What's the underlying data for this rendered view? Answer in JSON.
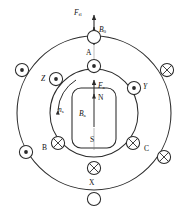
{
  "figure": {
    "type": "machine-cross-section",
    "geometry": {
      "center_x": 94,
      "center_y": 113,
      "outer_circle_r": 77,
      "inner_circle_r": 44,
      "conductor_r": 6.5,
      "rotor": {
        "x": 72,
        "y": 88,
        "w": 44,
        "h": 60,
        "corner_r": 9
      }
    },
    "stroke_color": "#2b2b2b",
    "background_color": "#ffffff"
  },
  "labels": {
    "force_top": {
      "text": "F",
      "sub": "fl"
    },
    "flux_resultant": {
      "text": "B",
      "sub": "0"
    },
    "phase_a": "A",
    "phase_b": "B",
    "phase_c": "C",
    "phase_x": "X",
    "phase_y": "Y",
    "phase_z": "Z",
    "force_armature": {
      "text": "F",
      "sub": "a"
    },
    "flux_armature": {
      "text": "B",
      "sub": "a"
    },
    "speed": {
      "text": "n",
      "sub": "s"
    },
    "pole_north": "N",
    "pole_south": "S"
  },
  "conductors": [
    {
      "id": "outer-top",
      "name": "A-return",
      "marker": "empty",
      "angle_deg": 90,
      "ring": "outer"
    },
    {
      "id": "inner-top",
      "name": "A",
      "marker": "dot",
      "angle_deg": 90,
      "ring": "inner"
    },
    {
      "id": "outer-upper-left",
      "name": "Z-outer",
      "marker": "dot",
      "angle_deg": 160,
      "ring": "outer"
    },
    {
      "id": "inner-upper-left",
      "name": "Z",
      "marker": "dot",
      "angle_deg": 150,
      "ring": "inner"
    },
    {
      "id": "outer-upper-right",
      "name": "Y-outer",
      "marker": "cross",
      "angle_deg": 20,
      "ring": "outer"
    },
    {
      "id": "inner-upper-right",
      "name": "Y",
      "marker": "dot",
      "angle_deg": 30,
      "ring": "inner"
    },
    {
      "id": "outer-lower-left",
      "name": "B-outer",
      "marker": "dot",
      "angle_deg": 200,
      "ring": "outer"
    },
    {
      "id": "inner-lower-left",
      "name": "B",
      "marker": "cross",
      "angle_deg": 210,
      "ring": "inner"
    },
    {
      "id": "outer-lower-right",
      "name": "C-outer",
      "marker": "cross",
      "angle_deg": 340,
      "ring": "outer"
    },
    {
      "id": "inner-lower-right",
      "name": "C",
      "marker": "cross",
      "angle_deg": 330,
      "ring": "inner"
    },
    {
      "id": "inner-bottom",
      "name": "X",
      "marker": "cross",
      "angle_deg": 270,
      "ring": "inner"
    },
    {
      "id": "outer-bottom",
      "name": "X-return",
      "marker": "empty",
      "angle_deg": 270,
      "ring": "outer"
    }
  ],
  "arrows": [
    {
      "name": "force-top-arrow",
      "from": [
        94,
        32
      ],
      "to": [
        94,
        16
      ],
      "dir": "up"
    },
    {
      "name": "flux-b0-arrow",
      "from": [
        94,
        46
      ],
      "to": [
        94,
        26
      ],
      "dir": "up"
    },
    {
      "name": "force-armature-arrow",
      "from": [
        94,
        98
      ],
      "to": [
        94,
        80
      ],
      "dir": "up"
    },
    {
      "name": "flux-ba-arrow",
      "from": [
        94,
        126
      ],
      "to": [
        94,
        94
      ],
      "dir": "up"
    },
    {
      "name": "speed-arc-arrow",
      "dir": "counterclockwise"
    }
  ]
}
